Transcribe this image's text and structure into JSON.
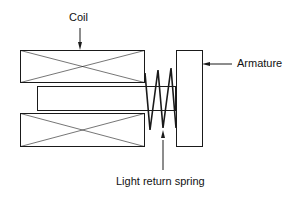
{
  "diagram": {
    "labels": {
      "coil": "Coil",
      "armature": "Armature",
      "spring": "Light return spring"
    },
    "colors": {
      "line": "#1a1a1a",
      "background": "#ffffff"
    }
  }
}
